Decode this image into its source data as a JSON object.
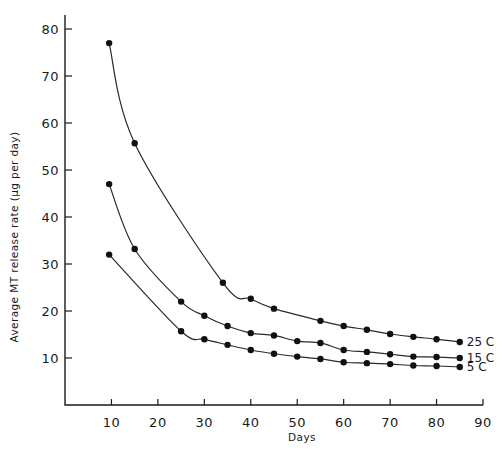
{
  "chart_data": {
    "type": "line",
    "title": "",
    "xlabel": "Days",
    "ylabel": "Average MT release rate (µg per day)",
    "xlim": [
      0,
      90
    ],
    "ylim": [
      0,
      80
    ],
    "xticks": [
      10,
      20,
      30,
      40,
      50,
      60,
      70,
      80,
      90
    ],
    "yticks": [
      10,
      20,
      30,
      40,
      50,
      60,
      70,
      80
    ],
    "xtick_labels": [
      "10",
      "20",
      "30",
      "40",
      "50",
      "60",
      "70",
      "80",
      "90"
    ],
    "ytick_labels": [
      "10",
      "20",
      "30",
      "40",
      "50",
      "60",
      "70",
      "80"
    ],
    "grid": false,
    "legend": "inline labels at right end of each curve",
    "series": [
      {
        "name": "25 C",
        "label": "25 C",
        "x": [
          9.5,
          15,
          34,
          40,
          45,
          55,
          60,
          65,
          70,
          75,
          80,
          85
        ],
        "y": [
          77,
          55.7,
          26,
          22.6,
          20.5,
          17.9,
          16.8,
          16,
          15.1,
          14.5,
          14,
          13.4
        ]
      },
      {
        "name": "15 C",
        "label": "15 C",
        "x": [
          9.5,
          15,
          25,
          30,
          35,
          40,
          45,
          50,
          55,
          60,
          65,
          70,
          75,
          80,
          85
        ],
        "y": [
          47,
          33.2,
          22,
          19,
          16.8,
          15.3,
          14.8,
          13.6,
          13.2,
          11.7,
          11.3,
          10.8,
          10.3,
          10.2,
          10
        ]
      },
      {
        "name": "5 C",
        "label": "5 C",
        "x": [
          9.5,
          25,
          30,
          35,
          40,
          45,
          50,
          55,
          60,
          65,
          70,
          75,
          80,
          85
        ],
        "y": [
          32,
          15.7,
          14,
          12.8,
          11.7,
          10.9,
          10.3,
          9.8,
          9.1,
          8.9,
          8.7,
          8.4,
          8.3,
          8.1
        ]
      }
    ]
  }
}
